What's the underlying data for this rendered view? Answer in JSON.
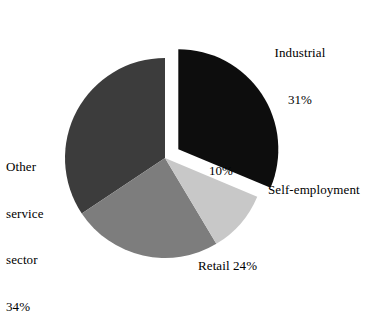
{
  "chart_data": {
    "type": "pie",
    "title": "",
    "subtitle": "",
    "xlabel": "",
    "ylabel": "",
    "grid": false,
    "legend_position": "none",
    "label_style": "outside-callout-text",
    "units": "percent",
    "total": 99,
    "start_angle_deg": 0,
    "direction": "clockwise",
    "categories": [
      "Industrial",
      "Self-employment",
      "Retail",
      "Other service sector"
    ],
    "values": [
      31,
      10,
      24,
      34
    ],
    "colors": [
      "#0d0d0d",
      "#c8c8c8",
      "#7d7d7d",
      "#3c3c3c"
    ],
    "exploded": [
      true,
      false,
      false,
      false
    ],
    "slices": [
      {
        "name": "Industrial",
        "value": 31,
        "display_value": "31%",
        "color": "#0d0d0d",
        "exploded": true,
        "label_position": "outside-top-right",
        "label_lines": [
          "Industrial",
          "31%"
        ]
      },
      {
        "name": "Self-employment",
        "value": 10,
        "display_value": "10%",
        "color": "#c8c8c8",
        "exploded": false,
        "label_position": "outside-right",
        "label_lines": [
          "Self-employment"
        ],
        "inner_label": "10%"
      },
      {
        "name": "Retail",
        "value": 24,
        "display_value": "24%",
        "color": "#7d7d7d",
        "exploded": false,
        "label_position": "outside-bottom",
        "label_lines": [
          "Retail 24%"
        ]
      },
      {
        "name": "Other service sector",
        "value": 34,
        "display_value": "34%",
        "color": "#3c3c3c",
        "exploded": false,
        "label_position": "outside-left",
        "label_lines": [
          "Other",
          "service",
          "sector",
          "34%"
        ]
      }
    ]
  },
  "labels": {
    "industrial_name": "Industrial",
    "industrial_pct": "31%",
    "self_employment_name": "Self-employment",
    "self_employment_pct": "10%",
    "retail": "Retail 24%",
    "other_line1": "Other",
    "other_line2": "service",
    "other_line3": "sector",
    "other_pct": "34%"
  },
  "style": {
    "background": "#ffffff",
    "text_color": "#000000",
    "slice_industrial": "#0d0d0d",
    "slice_self_employment": "#c8c8c8",
    "slice_retail": "#7d7d7d",
    "slice_other_service": "#3c3c3c"
  }
}
